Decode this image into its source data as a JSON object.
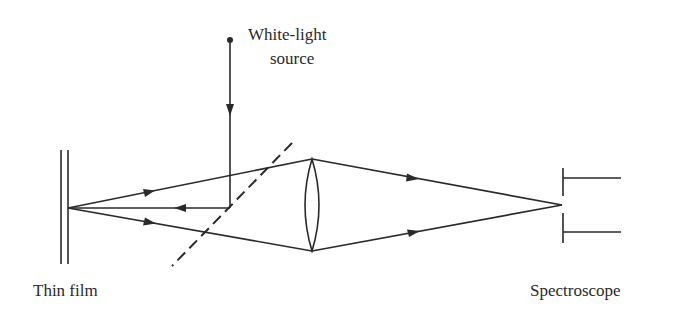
{
  "diagram": {
    "type": "optics-setup",
    "labels": {
      "source_line1": "White-light",
      "source_line2": "source",
      "film": "Thin film",
      "spectroscope": "Spectroscope"
    },
    "components": [
      "white-light source",
      "beam splitter (dashed)",
      "thin film",
      "converging lens",
      "spectroscope slit"
    ],
    "colors": {
      "ink": "#2a2a2a",
      "background": "#ffffff"
    }
  }
}
